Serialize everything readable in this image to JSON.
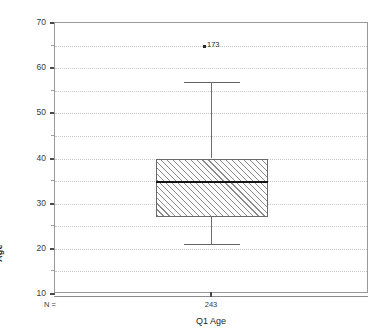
{
  "chart_data": {
    "type": "box",
    "title": "",
    "xlabel": "Q1 Age",
    "ylabel": "Age",
    "ylim": [
      10,
      70
    ],
    "grid": true,
    "legend": "none",
    "y_ticks_major": [
      70,
      60,
      50,
      40,
      30,
      20,
      10
    ],
    "y_ticks_minor": [
      65,
      55,
      45,
      35,
      25,
      15
    ],
    "gridline_values": [
      65,
      60,
      55,
      50,
      45,
      40,
      35,
      30,
      25,
      20,
      15
    ],
    "categories": [
      "Q1 Age"
    ],
    "n_label": "N =",
    "n_values": [
      "243"
    ],
    "boxes": [
      {
        "category": "Q1 Age",
        "n": "243",
        "whisker_low": 21,
        "q1": 27,
        "median": 35,
        "q3": 40,
        "whisker_high": 57,
        "outliers": [
          {
            "value": 65,
            "label": "173"
          }
        ]
      }
    ]
  },
  "axes": {
    "y_title": "Age",
    "x_title": "Q1 Age",
    "y_labels": [
      "70",
      "60",
      "50",
      "40",
      "30",
      "20",
      "10"
    ]
  },
  "footer": {
    "n_label": "N =",
    "n_value": "243"
  },
  "annotations": {
    "outlier_label": "173"
  },
  "colors": {
    "frame": "#9a9a9a",
    "gridline": "#c8c8c8",
    "box_border": "#6a6a6a",
    "hatch": "#8a8a8a",
    "median": "#141414",
    "whisker": "#6f6f6f",
    "text": "#2b2b2b",
    "background": "#ffffff"
  }
}
